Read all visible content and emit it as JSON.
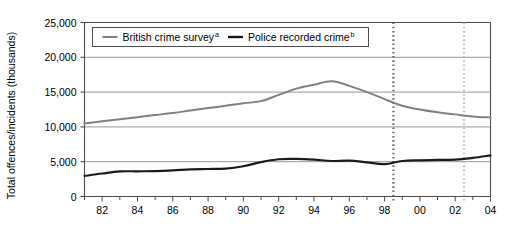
{
  "chart_data": {
    "type": "line",
    "title": "",
    "subtitle": "",
    "xlabel": "",
    "ylabel": "Total offences/incidents (thousands)",
    "ylim": [
      0,
      25000
    ],
    "xlim": [
      1981,
      2004
    ],
    "grid": true,
    "grid_axis": "y",
    "legend_position": "top-inside",
    "y_ticks": [
      0,
      5000,
      10000,
      15000,
      20000,
      25000
    ],
    "y_tick_labels": [
      "0",
      "5,000",
      "10,000",
      "15,000",
      "20,000",
      "25,000"
    ],
    "x_ticks": [
      1981,
      1982,
      1983,
      1984,
      1985,
      1986,
      1987,
      1988,
      1989,
      1990,
      1991,
      1992,
      1993,
      1994,
      1995,
      1996,
      1997,
      1998,
      1999,
      2000,
      2001,
      2002,
      2003,
      2004
    ],
    "x_tick_labels": [
      "",
      "82",
      "",
      "84",
      "",
      "86",
      "",
      "88",
      "",
      "90",
      "",
      "92",
      "",
      "94",
      "",
      "96",
      "",
      "98",
      "",
      "00",
      "",
      "02",
      "",
      "04"
    ],
    "x": [
      1981,
      1982,
      1983,
      1984,
      1985,
      1986,
      1987,
      1988,
      1989,
      1990,
      1991,
      1992,
      1993,
      1994,
      1995,
      1996,
      1997,
      1998,
      1999,
      2000,
      2001,
      2002,
      2003,
      2004
    ],
    "series": [
      {
        "name": "British crime survey",
        "footnote": "a",
        "color": "#808080",
        "width": 2.0,
        "values": [
          10500,
          10800,
          11100,
          11400,
          11700,
          12000,
          12350,
          12700,
          13050,
          13400,
          13700,
          14600,
          15500,
          16050,
          16550,
          15900,
          15000,
          14000,
          13050,
          12500,
          12100,
          11800,
          11500,
          11350
        ]
      },
      {
        "name": "Police recorded crime",
        "footnote": "b",
        "color": "#1a1a1a",
        "width": 2.2,
        "values": [
          2950,
          3300,
          3600,
          3620,
          3650,
          3750,
          3900,
          3950,
          4000,
          4350,
          4950,
          5350,
          5400,
          5300,
          5100,
          5150,
          4900,
          4650,
          5100,
          5200,
          5250,
          5300,
          5550,
          5900
        ]
      }
    ],
    "vertical_markers": [
      {
        "name": "marker-1998",
        "x": 1998.5,
        "color": "#6b6b6b",
        "style": "dotted",
        "width": 2.2
      },
      {
        "name": "marker-2002",
        "x": 2002.5,
        "color": "#c0c0c0",
        "style": "dotted",
        "width": 2.0
      }
    ]
  },
  "legend": {
    "items": [
      {
        "label": "British crime survey",
        "sup": "a",
        "color": "#808080"
      },
      {
        "label": "Police recorded crime",
        "sup": "b",
        "color": "#1a1a1a"
      }
    ]
  }
}
